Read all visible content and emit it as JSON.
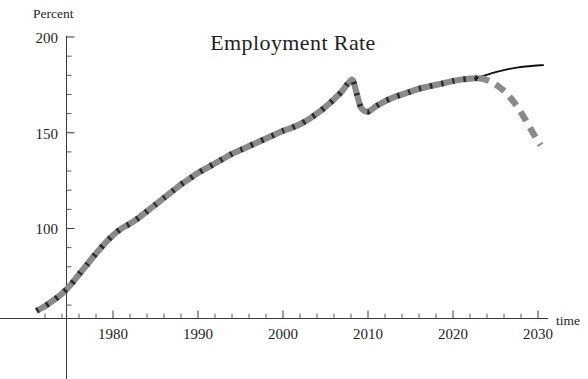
{
  "chart_data": {
    "type": "line",
    "title": "Employment  Rate",
    "xlabel": "time",
    "ylabel": "Percent",
    "xlim": [
      1970.5,
      2031
    ],
    "ylim": [
      55,
      205
    ],
    "grid": false,
    "legend": null,
    "x_ticks_major": [
      1980,
      1990,
      2000,
      2010,
      2020,
      2030
    ],
    "x_tick_labels": [
      "1980",
      "1990",
      "2000",
      "2010",
      "2020",
      "2030"
    ],
    "x_minor_step": 2,
    "y_ticks_major": [
      100,
      150,
      200
    ],
    "y_tick_labels": [
      "100",
      "150",
      "200"
    ],
    "y_minor_step": 10,
    "series": [
      {
        "name": "history",
        "style": "thick-gray-dashed",
        "color": "#8a8a8a",
        "x": [
          1971.0,
          1972.0,
          1973.0,
          1974.0,
          1975.0,
          1976.0,
          1977.0,
          1978.0,
          1979.0,
          1980.0,
          1981.0,
          1982.0,
          1983.0,
          1984.0,
          1985.0,
          1986.0,
          1987.0,
          1988.0,
          1989.0,
          1990.0,
          1991.0,
          1992.0,
          1993.0,
          1994.0,
          1995.0,
          1996.0,
          1997.0,
          1998.0,
          1999.0,
          2000.0,
          2001.0,
          2002.0,
          2003.0,
          2004.0,
          2005.0,
          2006.0,
          2007.0,
          2007.6,
          2008.2,
          2008.7,
          2009.2,
          2010.0,
          2011.0,
          2012.0,
          2013.0,
          2014.0,
          2015.0,
          2016.0,
          2017.0,
          2018.0,
          2019.0,
          2020.0,
          2021.0,
          2022.0,
          2023.0
        ],
        "y": [
          57.0,
          59.5,
          62.5,
          66.0,
          70.5,
          76.0,
          81.5,
          87.0,
          92.0,
          96.5,
          100.0,
          102.5,
          105.5,
          109.0,
          112.5,
          116.0,
          119.5,
          123.0,
          126.0,
          129.0,
          131.5,
          134.0,
          136.5,
          139.0,
          141.0,
          143.0,
          145.0,
          147.0,
          149.0,
          151.0,
          152.5,
          154.5,
          157.0,
          160.0,
          163.5,
          167.5,
          172.0,
          175.5,
          177.5,
          170.0,
          163.0,
          161.0,
          164.0,
          166.5,
          168.5,
          170.0,
          171.5,
          173.0,
          174.0,
          175.0,
          176.0,
          177.0,
          177.8,
          178.3,
          178.5
        ]
      },
      {
        "name": "projection-solid",
        "style": "thin-black-solid",
        "color": "#111111",
        "x": [
          2022.6,
          2023.5,
          2024.5,
          2025.5,
          2026.5,
          2027.5,
          2028.5,
          2029.5,
          2030.6
        ],
        "y": [
          178.3,
          179.6,
          181.0,
          182.2,
          183.2,
          184.0,
          184.6,
          185.0,
          185.3
        ]
      },
      {
        "name": "projection-dashed",
        "style": "thick-gray-dashed",
        "color": "#8a8a8a",
        "x": [
          2023.0,
          2023.8,
          2024.6,
          2025.4,
          2026.2,
          2027.0,
          2027.8,
          2028.5,
          2029.2,
          2029.8,
          2030.3
        ],
        "y": [
          178.5,
          177.8,
          176.3,
          174.0,
          171.0,
          167.0,
          162.0,
          157.0,
          151.5,
          147.0,
          143.5
        ]
      }
    ]
  },
  "labels": {
    "title": "Employment  Rate",
    "y_axis_name": "Percent",
    "x_axis_name": "time",
    "y_200": "200",
    "y_150": "150",
    "y_100": "100",
    "x_1980": "1980",
    "x_1990": "1990",
    "x_2000": "2000",
    "x_2010": "2010",
    "x_2020": "2020",
    "x_2030": "2030"
  }
}
